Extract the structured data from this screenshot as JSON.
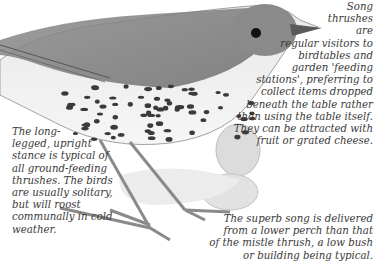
{
  "captions": {
    "right": [
      "Song",
      "thrushes",
      "are",
      "regular visitors to",
      "birdtables and",
      "garden 'feeding",
      "stations', preferring to",
      "collect items dropped",
      "beneath the table rather",
      "than using the table itself.",
      "They can be attracted with",
      "fruit or grated cheese."
    ],
    "left": [
      "The long-",
      "legged, upright",
      "stance is typical of",
      "all ground-feeding",
      "thrushes. The birds",
      "are usually solitary,",
      "but will roost",
      "communally in cold",
      "weather."
    ],
    "bottom": [
      "The superb song is delivered",
      "from a lower perch than that",
      "of the mistle thrush, a low bush",
      "or building being typical."
    ]
  },
  "illustration": {
    "subject": "song thrush",
    "icon": "song-thrush-illustration"
  },
  "page_mark": "′′"
}
